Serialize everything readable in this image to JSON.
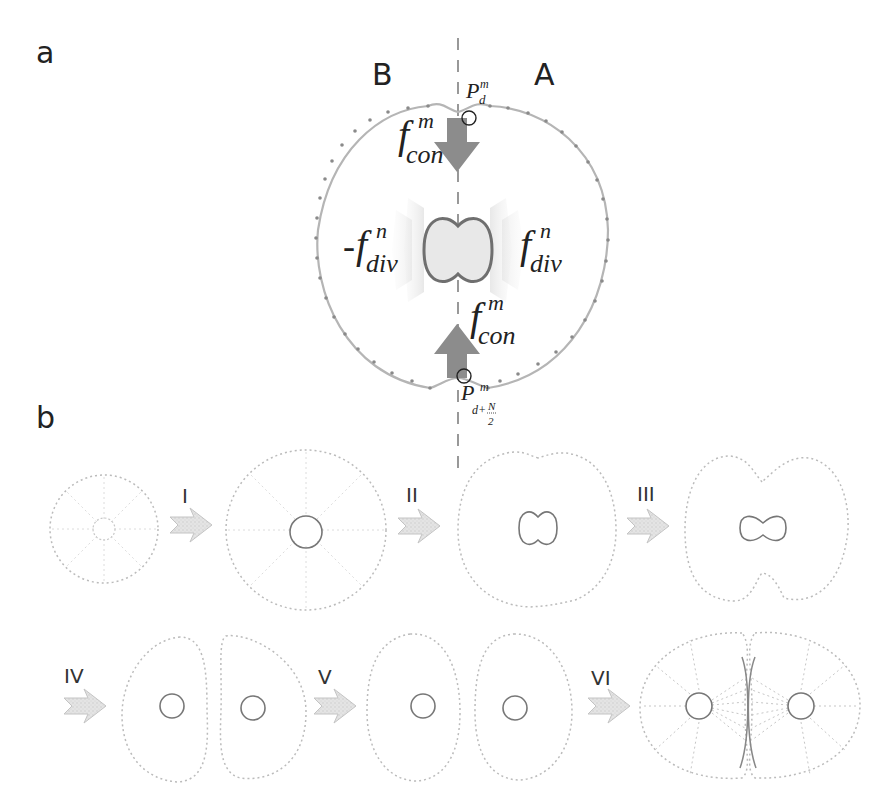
{
  "panel_a": {
    "label": "a",
    "side_left": "B",
    "side_right": "A",
    "point_top": {
      "base": "P",
      "sup": "m",
      "sub": "d"
    },
    "point_bottom": {
      "base": "P",
      "sup": "m",
      "sub": "d+",
      "frac_num": "N",
      "frac_den": "2"
    },
    "force_contract_top": {
      "base": "f",
      "sup": "m",
      "sub": "con"
    },
    "force_contract_bottom": {
      "base": "f",
      "sup": "m",
      "sub": "con"
    },
    "force_divide_left": {
      "prefix": "-",
      "base": "f",
      "sup": "n",
      "sub": "div"
    },
    "force_divide_right": {
      "base": "f",
      "sup": "n",
      "sub": "div"
    },
    "colors": {
      "membrane": "#b5b5b5",
      "membrane_dots": "#8a8a8a",
      "force_arrow": "#8c8c8c",
      "nucleus": "#6f6f6f",
      "divide_glow": "#e2e2e2"
    }
  },
  "panel_b": {
    "label": "b",
    "steps": [
      {
        "id": "I",
        "label": "I"
      },
      {
        "id": "II",
        "label": "II"
      },
      {
        "id": "III",
        "label": "III"
      },
      {
        "id": "IV",
        "label": "IV"
      },
      {
        "id": "V",
        "label": "V"
      },
      {
        "id": "VI",
        "label": "VI"
      }
    ],
    "stages": [
      "small-round-cell",
      "large-round-cell",
      "cell-with-dumbbell-nucleus",
      "cell-with-furrow",
      "separated-daughter-cells",
      "rounded-daughter-cells",
      "daughters-with-spindle"
    ]
  }
}
